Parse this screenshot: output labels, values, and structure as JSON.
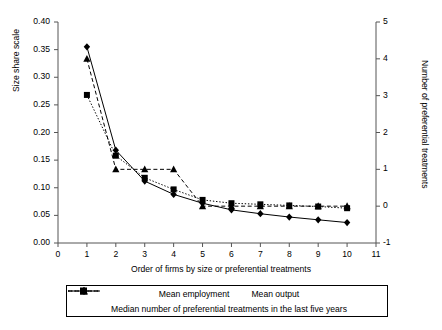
{
  "chart_data": {
    "type": "line",
    "title": "",
    "xlabel": "Order of firms by size or preferential treatments",
    "ylabel": "Size share scale",
    "ylabel_right": "Number of preferential treatments",
    "x": [
      1,
      2,
      3,
      4,
      5,
      6,
      7,
      8,
      9,
      10
    ],
    "xlim": [
      0,
      11
    ],
    "xticks": [
      "0",
      "1",
      "2",
      "3",
      "4",
      "5",
      "6",
      "7",
      "8",
      "9",
      "10",
      "11"
    ],
    "xtick_values": [
      0,
      1,
      2,
      3,
      4,
      5,
      6,
      7,
      8,
      9,
      10,
      11
    ],
    "ylim": [
      0.0,
      0.4
    ],
    "yticks": [
      "0.00",
      "0.05",
      "0.10",
      "0.15",
      "0.20",
      "0.25",
      "0.30",
      "0.35",
      "0.40"
    ],
    "ytick_values": [
      0.0,
      0.05,
      0.1,
      0.15,
      0.2,
      0.25,
      0.3,
      0.35,
      0.4
    ],
    "ylim_right": [
      -1,
      5
    ],
    "yticks_right": [
      "-1",
      "0",
      "1",
      "2",
      "3",
      "4",
      "5"
    ],
    "ytick_values_right": [
      -1,
      0,
      1,
      2,
      3,
      4,
      5
    ],
    "grid": false,
    "legend_position": "bottom",
    "series": [
      {
        "name": "Mean employment",
        "axis": "left",
        "marker": "square",
        "linestyle": "dotted",
        "color": "#000000",
        "values": [
          0.268,
          0.158,
          0.118,
          0.097,
          0.078,
          0.072,
          0.07,
          0.068,
          0.066,
          0.063
        ]
      },
      {
        "name": "Mean output",
        "axis": "left",
        "marker": "diamond",
        "linestyle": "solid",
        "color": "#000000",
        "values": [
          0.355,
          0.168,
          0.112,
          0.088,
          0.072,
          0.06,
          0.053,
          0.047,
          0.042,
          0.037
        ]
      },
      {
        "name": "Median number of preferential treatments in the last five years",
        "axis": "right",
        "marker": "triangle",
        "linestyle": "dashed",
        "color": "#000000",
        "values_right": [
          4,
          1,
          1,
          1,
          0,
          0,
          0,
          0,
          0,
          0
        ],
        "values_left_equivalent": [
          0.333,
          0.135,
          0.135,
          0.135,
          0.07,
          0.07,
          0.07,
          0.07,
          0.07,
          0.07
        ]
      }
    ]
  },
  "legend": {
    "entries": [
      {
        "label": "Mean employment",
        "marker": "square",
        "linestyle": "dotted"
      },
      {
        "label": "Mean output",
        "marker": "diamond",
        "linestyle": "solid"
      },
      {
        "label": "Median number of preferential treatments in the last five years",
        "marker": "triangle",
        "linestyle": "dashed"
      }
    ]
  }
}
